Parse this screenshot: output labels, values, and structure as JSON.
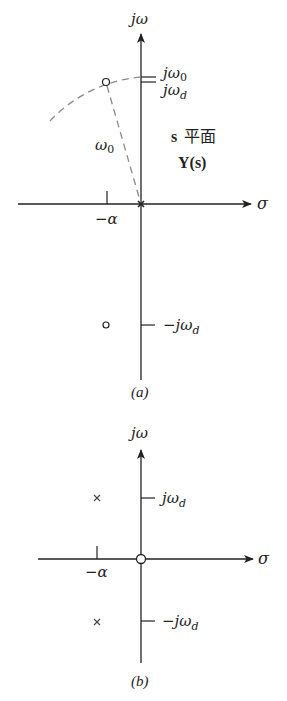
{
  "figure_a": {
    "caption": "(a)",
    "axis_labels": {
      "vertical": "jω",
      "horizontal": "σ"
    },
    "tick_labels": {
      "jw0": "jω",
      "jw0_sub": "0",
      "jwd": "jω",
      "jwd_sub": "d",
      "neg_jwd": "−jω",
      "neg_jwd_sub": "d",
      "neg_alpha": "−α"
    },
    "radius_label": "ω",
    "radius_label_sub": "0",
    "plane_label_s": "s",
    "plane_label_cn": "平面",
    "function_label": "Y(s)",
    "markers": [
      {
        "type": "zero",
        "location": "-α + jωd"
      },
      {
        "type": "zero",
        "location": "-α - jωd"
      },
      {
        "type": "pole",
        "location": "0"
      }
    ]
  },
  "figure_b": {
    "caption": "(b)",
    "axis_labels": {
      "vertical": "jω",
      "horizontal": "σ"
    },
    "tick_labels": {
      "jwd": "jω",
      "jwd_sub": "d",
      "neg_jwd": "−jω",
      "neg_jwd_sub": "d",
      "neg_alpha": "−α"
    },
    "markers": [
      {
        "type": "pole",
        "location": "-α + jωd"
      },
      {
        "type": "pole",
        "location": "-α - jωd"
      },
      {
        "type": "zero",
        "location": "0"
      }
    ]
  },
  "colors": {
    "line": "#222222",
    "dashed": "#8a8a8a"
  }
}
